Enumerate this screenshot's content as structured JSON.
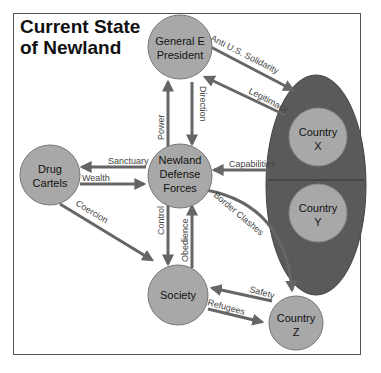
{
  "title": {
    "line1": "Current State",
    "line2": "of Newland"
  },
  "colors": {
    "node_fill": "#a8a8a8",
    "node_stroke": "#777777",
    "ellipse_fill": "#5a5a5a",
    "arrow": "#666666",
    "frame": "#555555"
  },
  "nodes": {
    "president": {
      "line1": "General E",
      "line2": "President"
    },
    "ndf": {
      "line1": "Newland",
      "line2": "Defense",
      "line3": "Forces"
    },
    "cartels": {
      "line1": "Drug",
      "line2": "Cartels"
    },
    "society": {
      "line1": "Society"
    },
    "country_x": {
      "line1": "Country",
      "line2": "X"
    },
    "country_y": {
      "line1": "Country",
      "line2": "Y"
    },
    "country_z": {
      "line1": "Country",
      "line2": "Z"
    }
  },
  "edges": {
    "anti_us": "Anti U.S. Solidarity",
    "legitimacy": "Legitimacy",
    "power": "Power",
    "direction": "Direction",
    "sanctuary": "Sanctuary",
    "wealth": "Wealth",
    "capabilities": "Capabilities",
    "coercion": "Coercion",
    "control": "Control",
    "obedience": "Obedience",
    "border_clashes": "Border Clashes",
    "safety": "Safety",
    "refugees": "Refugees"
  }
}
